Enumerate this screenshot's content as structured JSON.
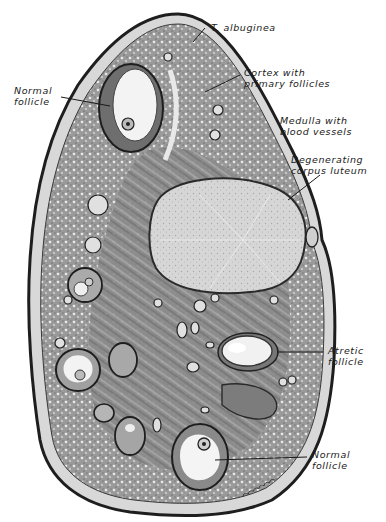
{
  "figure": {
    "colors": {
      "background": "#ffffff",
      "ink": "#1a1a1a",
      "stroma": "#8c8c8c",
      "stroma_dark": "#555555",
      "cortex": "#a3a3a3",
      "follicle_fluid": "#f4f4f4",
      "corpus_luteum": "#d9d9d9"
    }
  },
  "labels": {
    "t_albuginea": {
      "line1": "T. albuginea"
    },
    "cortex": {
      "line1": "Cortex with",
      "line2": "primary follicles"
    },
    "normal_follicle_top": {
      "line1": "Normal",
      "line2": "follicle"
    },
    "medulla": {
      "line1": "Medulla with",
      "line2": "blood vessels"
    },
    "corpus_luteum": {
      "line1": "Degenerating",
      "line2": "corpus luteum"
    },
    "atretic_follicle": {
      "line1": "Atretic",
      "line2": "follicle"
    },
    "normal_follicle_bottom": {
      "line1": "Normal",
      "line2": "follicle"
    }
  }
}
